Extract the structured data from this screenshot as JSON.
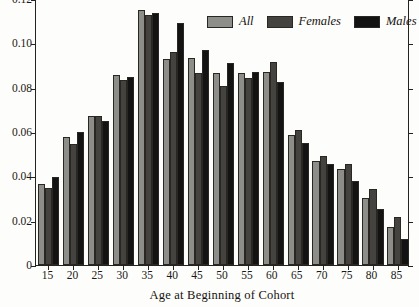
{
  "chart_data": {
    "type": "bar",
    "title": "",
    "xlabel": "Age at Beginning of Cohort",
    "ylabel": "",
    "categories": [
      "15",
      "20",
      "25",
      "30",
      "35",
      "40",
      "45",
      "50",
      "55",
      "60",
      "65",
      "70",
      "75",
      "80",
      "85"
    ],
    "ylim": [
      0,
      0.12
    ],
    "yticks": [
      0,
      0.02,
      0.04,
      0.06,
      0.08,
      0.1,
      0.12
    ],
    "ytick_labels": [
      "0",
      "0.02",
      "0.04",
      "0.06",
      "0.08",
      "0.10",
      "0.12"
    ],
    "grid": false,
    "legend_position": "top-right",
    "series": [
      {
        "name": "All",
        "color": "#8d8d8a",
        "values": [
          0.0365,
          0.0577,
          0.0672,
          0.0858,
          0.1152,
          0.0928,
          0.0932,
          0.0865,
          0.0864,
          0.0872,
          0.0586,
          0.0469,
          0.0435,
          0.0303,
          0.0172
        ]
      },
      {
        "name": "Females",
        "color": "#454340",
        "values": [
          0.0346,
          0.0548,
          0.0672,
          0.0836,
          0.1127,
          0.0961,
          0.0866,
          0.0809,
          0.0845,
          0.0917,
          0.061,
          0.0492,
          0.0457,
          0.0344,
          0.0215
        ]
      },
      {
        "name": "Males",
        "color": "#141313",
        "values": [
          0.0396,
          0.0601,
          0.0649,
          0.085,
          0.1139,
          0.109,
          0.0972,
          0.0912,
          0.0872,
          0.0824,
          0.0549,
          0.0456,
          0.0378,
          0.0253,
          0.0118
        ]
      }
    ]
  },
  "axes": {
    "y_tick_labels": [
      "0.12",
      "0.10",
      "0.08",
      "0.06",
      "0.04",
      "0.02",
      "0"
    ],
    "x_tick_labels": [
      "15",
      "20",
      "25",
      "30",
      "35",
      "40",
      "45",
      "50",
      "55",
      "60",
      "65",
      "70",
      "75",
      "80",
      "85"
    ],
    "x_axis_title": "Age at Beginning of Cohort"
  },
  "legend": {
    "items": [
      {
        "label": "All",
        "swatch": "all-swatch"
      },
      {
        "label": "Females",
        "swatch": "females-swatch"
      },
      {
        "label": "Males",
        "swatch": "males-swatch"
      }
    ]
  }
}
